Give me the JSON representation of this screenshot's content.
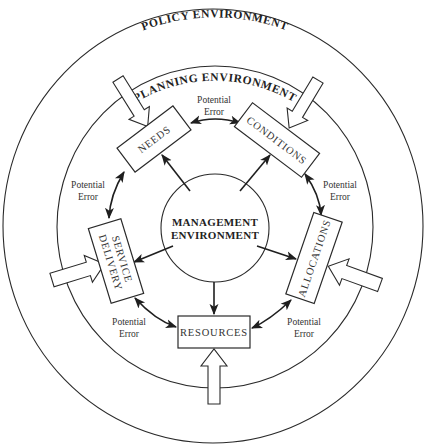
{
  "diagram": {
    "environments": {
      "outer": "POLICY ENVIRONMENT",
      "middle": "PLANNING ENVIRONMENT",
      "center_line1": "MANAGEMENT",
      "center_line2": "ENVIRONMENT"
    },
    "nodes": [
      {
        "id": "needs",
        "lines": [
          "NEEDS"
        ]
      },
      {
        "id": "conditions",
        "lines": [
          "CONDITIONS"
        ]
      },
      {
        "id": "allocations",
        "lines": [
          "ALLOCATIONS"
        ]
      },
      {
        "id": "resources",
        "lines": [
          "RESOURCES"
        ]
      },
      {
        "id": "service-delivery",
        "lines": [
          "SERVICE",
          "DELIVERY"
        ]
      }
    ],
    "error_labels": [
      {
        "between": "needs-conditions",
        "line1": "Potential",
        "line2": "Error"
      },
      {
        "between": "conditions-allocations",
        "line1": "Potential",
        "line2": "Error"
      },
      {
        "between": "allocations-resources",
        "line1": "Potential",
        "line2": "Error"
      },
      {
        "between": "resources-service-delivery",
        "line1": "Potential",
        "line2": "Error"
      },
      {
        "between": "service-delivery-needs",
        "line1": "Potential",
        "line2": "Error"
      }
    ],
    "edges": [
      {
        "from": "management",
        "to": "needs",
        "type": "directed"
      },
      {
        "from": "management",
        "to": "conditions",
        "type": "directed"
      },
      {
        "from": "management",
        "to": "allocations",
        "type": "directed"
      },
      {
        "from": "management",
        "to": "resources",
        "type": "directed"
      },
      {
        "from": "management",
        "to": "service-delivery",
        "type": "directed"
      },
      {
        "from": "needs",
        "to": "conditions",
        "type": "bidirectional"
      },
      {
        "from": "conditions",
        "to": "allocations",
        "type": "bidirectional"
      },
      {
        "from": "allocations",
        "to": "resources",
        "type": "bidirectional"
      },
      {
        "from": "resources",
        "to": "service-delivery",
        "type": "bidirectional"
      },
      {
        "from": "service-delivery",
        "to": "needs",
        "type": "bidirectional"
      },
      {
        "from": "policy",
        "to": "needs",
        "type": "external-input"
      },
      {
        "from": "policy",
        "to": "conditions",
        "type": "external-input"
      },
      {
        "from": "policy",
        "to": "allocations",
        "type": "external-input"
      },
      {
        "from": "policy",
        "to": "resources",
        "type": "external-input"
      },
      {
        "from": "policy",
        "to": "service-delivery",
        "type": "external-input"
      }
    ]
  }
}
